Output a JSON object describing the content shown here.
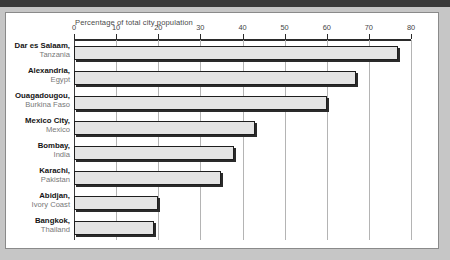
{
  "chart_data": {
    "type": "bar",
    "orientation": "horizontal",
    "title": "Percentage of total city population",
    "xlabel": "Percentage of total city population",
    "ylabel": "",
    "xlim": [
      0,
      80
    ],
    "xticks": [
      0,
      10,
      20,
      30,
      40,
      50,
      60,
      70,
      80
    ],
    "grid": true,
    "legend": null,
    "categories": [
      "Dar es Salaam, Tanzania",
      "Alexandria, Egypt",
      "Ouagadougou, Burkina Faso",
      "Mexico City, Mexico",
      "Bombay, India",
      "Karachi, Pakistan",
      "Abidjan, Ivory Coast",
      "Bangkok, Thailand"
    ],
    "values": [
      77,
      67,
      60,
      43,
      38,
      35,
      20,
      19
    ],
    "bar_fill": "#e4e4e4",
    "bar_border": "#1e1e1e"
  },
  "chart": {
    "title": "Percentage of total city population",
    "axis": {
      "ticks": [
        "0",
        "10",
        "20",
        "30",
        "40",
        "50",
        "60",
        "70",
        "80"
      ],
      "max": 80
    },
    "rows": [
      {
        "city": "Dar es Salaam,",
        "country": "Tanzania",
        "value": 77
      },
      {
        "city": "Alexandria,",
        "country": "Egypt",
        "value": 67
      },
      {
        "city": "Ouagadougou,",
        "country": "Burkina Faso",
        "value": 60
      },
      {
        "city": "Mexico City,",
        "country": "Mexico",
        "value": 43
      },
      {
        "city": "Bombay,",
        "country": "India",
        "value": 38
      },
      {
        "city": "Karachi,",
        "country": "Pakistan",
        "value": 35
      },
      {
        "city": "Abidjan,",
        "country": "Ivory Coast",
        "value": 20
      },
      {
        "city": "Bangkok,",
        "country": "Thailand",
        "value": 19
      }
    ]
  },
  "colors": {
    "page_background": "#c6c6c6",
    "card_background": "#ffffff",
    "bar_fill": "#e4e4e4",
    "bar_outline": "#1e1e1e",
    "gridline": "#b4b4b4",
    "axis": "#2b2b2b",
    "city_text": "#141414",
    "country_text": "#787878"
  }
}
